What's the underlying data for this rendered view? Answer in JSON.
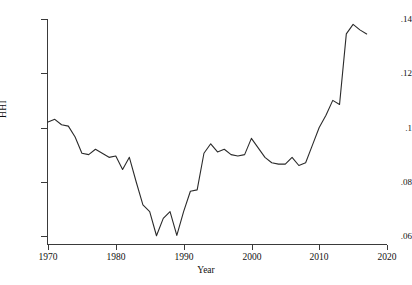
{
  "chart_data": {
    "type": "line",
    "title": "",
    "xlabel": "Year",
    "ylabel": "HHI",
    "xlim": [
      1970,
      2020
    ],
    "ylim": [
      0.06,
      0.14
    ],
    "grid": false,
    "legend": null,
    "xticks": [
      "1970",
      "1980",
      "1990",
      "2000",
      "2010",
      "2020"
    ],
    "xtick_values": [
      1970,
      1980,
      1990,
      2000,
      2010,
      2020
    ],
    "yticks": [
      ".06",
      ".08",
      ".1",
      ".12",
      ".14"
    ],
    "ytick_values": [
      0.06,
      0.08,
      0.1,
      0.12,
      0.14
    ],
    "series": [
      {
        "name": "HHI",
        "color": "#2b2b2b",
        "x": [
          1970,
          1971,
          1972,
          1973,
          1974,
          1975,
          1976,
          1977,
          1978,
          1979,
          1980,
          1981,
          1982,
          1983,
          1984,
          1985,
          1986,
          1987,
          1988,
          1989,
          1990,
          1991,
          1992,
          1993,
          1994,
          1995,
          1996,
          1997,
          1998,
          1999,
          2000,
          2001,
          2002,
          2003,
          2004,
          2005,
          2006,
          2007,
          2008,
          2009,
          2010,
          2011,
          2012,
          2013,
          2014,
          2015,
          2016,
          2017
        ],
        "y": [
          0.102,
          0.103,
          0.101,
          0.1005,
          0.0965,
          0.0905,
          0.09,
          0.092,
          0.0905,
          0.089,
          0.0895,
          0.0845,
          0.089,
          0.08,
          0.0715,
          0.069,
          0.0601,
          0.0665,
          0.069,
          0.0602,
          0.069,
          0.0765,
          0.077,
          0.0905,
          0.094,
          0.091,
          0.092,
          0.09,
          0.0895,
          0.09,
          0.096,
          0.0925,
          0.089,
          0.087,
          0.0865,
          0.0865,
          0.089,
          0.086,
          0.087,
          0.0935,
          0.1,
          0.1045,
          0.11,
          0.1085,
          0.1345,
          0.138,
          0.136,
          0.1345
        ]
      }
    ]
  },
  "axes": {
    "y_title": "HHI",
    "x_title": "Year"
  }
}
